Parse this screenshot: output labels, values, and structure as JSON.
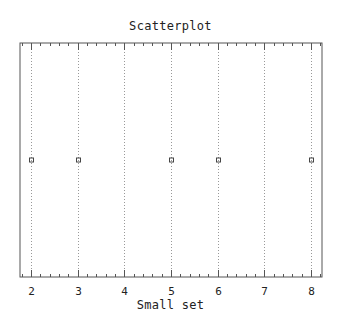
{
  "chart_data": {
    "type": "scatter",
    "title": "Scatterplot",
    "xlabel": "Small set",
    "ylabel": "",
    "x": [
      2,
      3,
      5,
      6,
      8
    ],
    "y": [
      0,
      0,
      0,
      0,
      0
    ],
    "xlim": [
      2,
      8
    ],
    "xticks": [
      2,
      3,
      4,
      5,
      6,
      7,
      8
    ],
    "minor_ticks_per_major": 4,
    "grid": "vertical dotted at major x ticks",
    "legend": null,
    "marker": "small open square"
  },
  "colors": {
    "frame": "#555555",
    "grid": "#999999",
    "marker": "#444444",
    "text": "#222222"
  }
}
